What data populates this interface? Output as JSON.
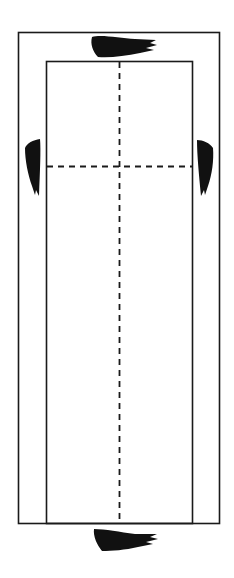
{
  "diagram": {
    "title": "",
    "colors": {
      "line": "#1a1a1a",
      "background": "#ffffff",
      "marker": "#111111"
    },
    "outer_rect": {
      "x": 18,
      "y": 32,
      "width": 202,
      "height": 492
    },
    "inner_rect": {
      "x": 46,
      "y": 61,
      "width": 147,
      "height": 463
    },
    "center_line": {
      "x": 119,
      "y1": 61,
      "y2": 524,
      "style": "dashed"
    },
    "cross_line": {
      "y": 166,
      "x1": 46,
      "x2": 193,
      "style": "dashed"
    },
    "markers": [
      {
        "name": "top",
        "x": 90,
        "y": 35,
        "w": 67,
        "h": 23
      },
      {
        "name": "left",
        "x": 24,
        "y": 139,
        "w": 17,
        "h": 57
      },
      {
        "name": "right",
        "x": 196,
        "y": 140,
        "w": 18,
        "h": 56
      },
      {
        "name": "bottom",
        "x": 92,
        "y": 528,
        "w": 66,
        "h": 23
      }
    ]
  }
}
